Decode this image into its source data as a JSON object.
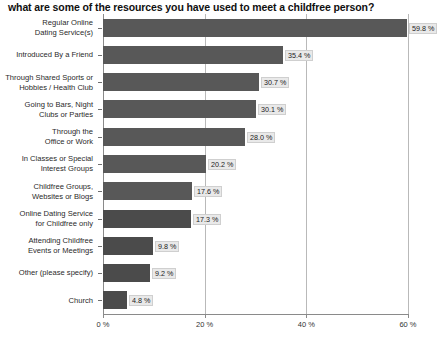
{
  "chart_data": {
    "type": "bar",
    "orientation": "horizontal",
    "title": "what are some of the resources you have used to meet a childfree person?",
    "xlabel": "",
    "ylabel": "",
    "xlim": [
      0,
      60
    ],
    "grid": true,
    "legend": "none",
    "value_suffix": " %",
    "xticks": [
      "0 %",
      "20 %",
      "40 %",
      "60 %"
    ],
    "xtick_values": [
      0,
      20,
      40,
      60
    ],
    "categories": [
      "Regular Online\nDating Service(s)",
      "Introduced By a Friend",
      "Through Shared Sports or\nHobbies / Health Club",
      "Going to Bars, Night\nClubs or Parties",
      "Through the\nOffice or Work",
      "In Classes or Special\nInterest Groups",
      "Childfree Groups,\nWebsites or Blogs",
      "Online Dating Service\nfor Childfree only",
      "Attending Childfree\nEvents or Meetings",
      "Other (please specify)",
      "Church"
    ],
    "values": [
      59.8,
      35.4,
      30.7,
      30.1,
      28.0,
      20.2,
      17.6,
      17.3,
      9.8,
      9.2,
      4.8
    ],
    "value_labels": [
      "59.8 %",
      "35.4 %",
      "30.7 %",
      "30.1 %",
      "28.0 %",
      "20.2 %",
      "17.6 %",
      "17.3 %",
      "9.8 %",
      "9.2 %",
      "4.8 %"
    ],
    "bar_color": "#585858",
    "bar_color_alt": "#4b4b4b",
    "grid_color": "#b9b9b9",
    "axis_color": "#8a8a8a"
  }
}
